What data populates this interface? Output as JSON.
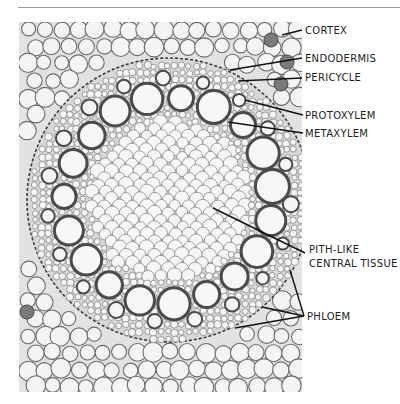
{
  "figure": {
    "header_text": "",
    "colors": {
      "background": "#ffffff",
      "cortex_cell_fill": "#f4f4f4",
      "cell_wall": "#6a6a6a",
      "vessel_wall": "#4a4a4a",
      "stained_cell": "#7a7a7a",
      "leader_line": "#111111",
      "label_text": "#222222"
    },
    "labels": [
      {
        "id": "cortex",
        "text": "CORTEX"
      },
      {
        "id": "endodermis",
        "text": "ENDODERMIS"
      },
      {
        "id": "pericycle",
        "text": "PERICYCLE"
      },
      {
        "id": "protoxylem",
        "text": "PROTOXYLEM"
      },
      {
        "id": "metaxylem",
        "text": "METAXYLEM"
      },
      {
        "id": "pith",
        "text": "PITH-LIKE",
        "text2": "CENTRAL  TISSUE"
      },
      {
        "id": "phloem",
        "text": "PHLOEM"
      }
    ]
  }
}
